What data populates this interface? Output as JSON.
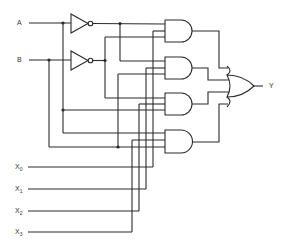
{
  "diagram": {
    "type": "4-to-1 multiplexer logic circuit",
    "select_inputs": [
      {
        "label": "A"
      },
      {
        "label": "B"
      }
    ],
    "data_inputs": [
      {
        "label": "X",
        "sub": "0"
      },
      {
        "label": "X",
        "sub": "1"
      },
      {
        "label": "X",
        "sub": "2"
      },
      {
        "label": "X",
        "sub": "3"
      }
    ],
    "output": {
      "label": "Y"
    },
    "gates": {
      "not": [
        "NOT A",
        "NOT B"
      ],
      "and": [
        "AND 1",
        "AND 2",
        "AND 3",
        "AND 4"
      ],
      "or": [
        "OR"
      ]
    },
    "colors": {
      "line": "#2b2b2b",
      "background": "#ffffff"
    }
  }
}
